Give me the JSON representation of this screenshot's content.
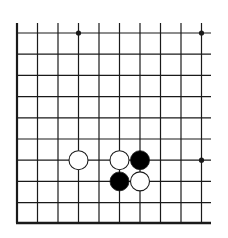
{
  "diagram": {
    "type": "go-board-fragment",
    "background": "#ffffff",
    "line_color": "#1a1a1a",
    "columns_x": [
      17,
      37.5,
      58,
      78.5,
      99,
      119.5,
      140,
      160.5,
      181,
      201.5
    ],
    "rows_y": [
      33,
      54.2,
      75.4,
      96.6,
      117.8,
      139,
      160.2,
      181.4,
      202.6
    ],
    "bottom_edge_y": 223,
    "left_edge_x": 17,
    "open_top_y": 23,
    "open_right_x": 211,
    "star_points": [
      {
        "col": 3,
        "row": 0
      },
      {
        "col": 9,
        "row": 0
      },
      {
        "col": 9,
        "row": 6
      }
    ],
    "stones": [
      {
        "color": "white",
        "col": 3,
        "row": 6
      },
      {
        "color": "white",
        "col": 5,
        "row": 6
      },
      {
        "color": "black",
        "col": 6,
        "row": 6
      },
      {
        "color": "black",
        "col": 5,
        "row": 7
      },
      {
        "color": "white",
        "col": 6,
        "row": 7
      }
    ],
    "stone_radius": 9.5
  }
}
